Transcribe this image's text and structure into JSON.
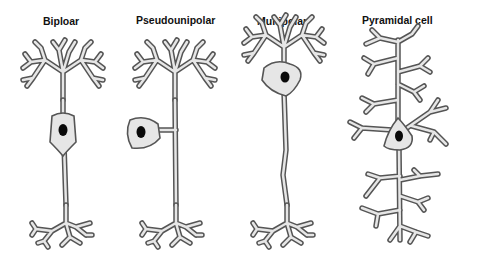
{
  "figure": {
    "type": "neuron-types-diagram",
    "neurons": [
      {
        "id": "bipolar",
        "label": "Biploar"
      },
      {
        "id": "pseudounipolar",
        "label": "Pseudounipolar"
      },
      {
        "id": "multipolar",
        "label": "Multipolar"
      },
      {
        "id": "pyramidal",
        "label": "Pyramidal cell"
      }
    ],
    "colors": {
      "outline": "#555555",
      "fill": "#e6e6e6",
      "nucleus": "#0a0a0a",
      "background": "#ffffff"
    }
  }
}
